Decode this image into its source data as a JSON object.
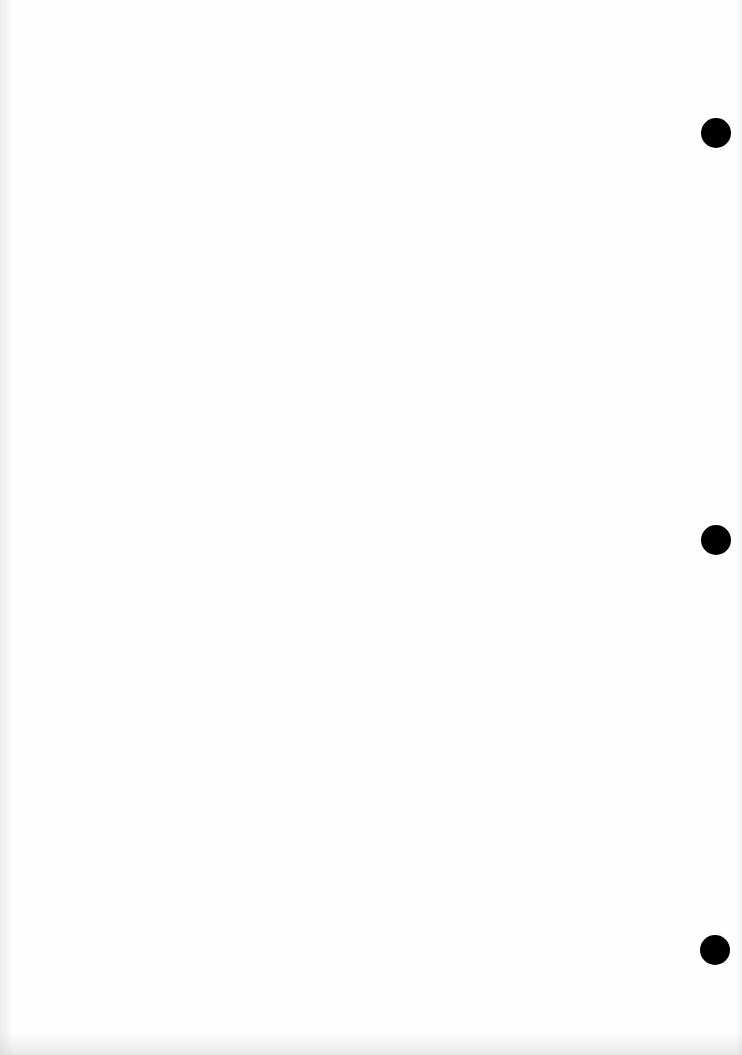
{
  "document": {
    "type": "blank-scanned-page",
    "width": 742,
    "height": 1055,
    "background_color": "#fefefe",
    "bleed_through_text": "",
    "punch_holes": [
      {
        "cx": 716,
        "cy": 133,
        "r": 15,
        "color": "#000000"
      },
      {
        "cx": 716,
        "cy": 540,
        "r": 15,
        "color": "#000000"
      },
      {
        "cx": 715,
        "cy": 950,
        "r": 15,
        "color": "#000000"
      }
    ]
  }
}
